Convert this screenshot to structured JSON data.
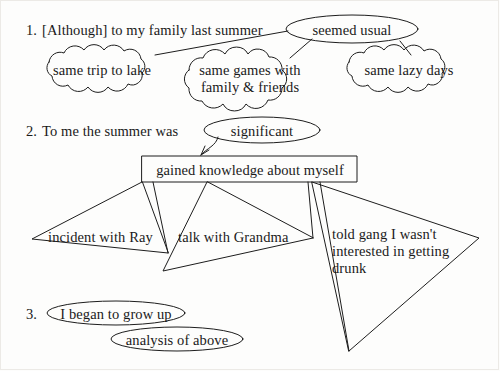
{
  "diagram": {
    "ink_color": "#1d1d1d",
    "paper_color": "#fdfdfc"
  },
  "sections": [
    {
      "number": "1.",
      "stem": "[Although] to my family last summer",
      "oval": "seemed usual",
      "clouds": [
        "same trip to lake",
        "same games with\nfamily & friends",
        "same lazy days"
      ]
    },
    {
      "number": "2.",
      "stem": "To me the summer was",
      "oval": "significant",
      "box": "gained knowledge about myself",
      "branches": [
        "incident with Ray",
        "talk with Grandma",
        "told gang I wasn't\ninterested in getting\ndrunk"
      ]
    },
    {
      "number": "3.",
      "ovals": [
        "I began to grow up",
        "analysis of above"
      ]
    }
  ]
}
